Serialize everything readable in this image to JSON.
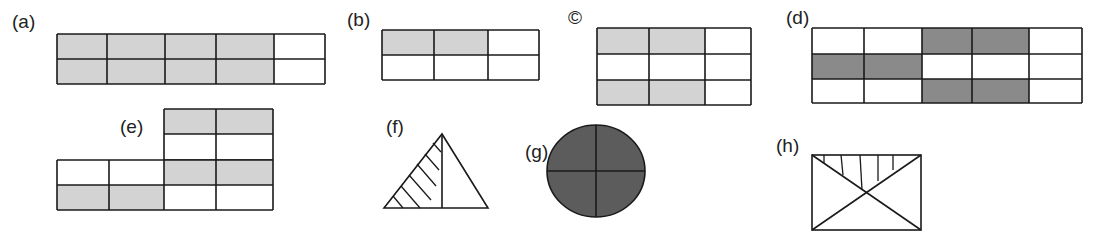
{
  "colors": {
    "line": "#1a1a1a",
    "light_shade": "#d3d3d3",
    "dark_shade": "#8a8a8a",
    "circle_fill": "#5c5c5c",
    "background": "#ffffff"
  },
  "figures": [
    {
      "id": "a",
      "label": "(a)",
      "type": "grid",
      "rows": 2,
      "cols": 5,
      "shaded": [
        [
          1,
          1,
          1,
          1,
          0
        ],
        [
          1,
          1,
          1,
          1,
          0
        ]
      ],
      "shade": "light"
    },
    {
      "id": "b",
      "label": "(b)",
      "type": "grid",
      "rows": 2,
      "cols": 3,
      "shaded": [
        [
          1,
          1,
          0
        ],
        [
          0,
          0,
          0
        ]
      ],
      "shade": "light"
    },
    {
      "id": "c",
      "label": "©",
      "type": "grid",
      "rows": 3,
      "cols": 3,
      "shaded": [
        [
          1,
          1,
          0
        ],
        [
          0,
          0,
          0
        ],
        [
          1,
          1,
          0
        ]
      ],
      "shade": "light"
    },
    {
      "id": "d",
      "label": "(d)",
      "type": "grid",
      "rows": 3,
      "cols": 5,
      "shaded": [
        [
          0,
          0,
          1,
          1,
          0
        ],
        [
          1,
          1,
          0,
          0,
          0
        ],
        [
          0,
          0,
          1,
          1,
          0
        ]
      ],
      "shade": "dark"
    },
    {
      "id": "e",
      "label": "(e)",
      "type": "composite-grid",
      "upper_block": {
        "rows": 2,
        "cols": 2,
        "shaded": [
          [
            1,
            1
          ],
          [
            0,
            0
          ]
        ]
      },
      "lower_block": {
        "rows": 2,
        "cols": 4,
        "shaded": [
          [
            0,
            0,
            1,
            1
          ],
          [
            1,
            1,
            0,
            0
          ]
        ]
      },
      "shade": "light"
    },
    {
      "id": "f",
      "label": "(f)",
      "type": "triangle",
      "description": "triangle split by vertical line from apex; left part hatched"
    },
    {
      "id": "g",
      "label": "(g)",
      "type": "ellipse",
      "description": "ellipse divided into 4 quarters, fully shaded dark"
    },
    {
      "id": "h",
      "label": "(h)",
      "type": "rectangle",
      "description": "rectangle with both diagonals; top triangle hatched with vertical lines"
    }
  ]
}
